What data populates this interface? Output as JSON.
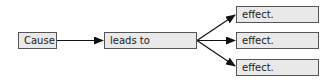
{
  "diagram": {
    "type": "cause-effect flow",
    "cause": {
      "label": "Cause"
    },
    "connector": {
      "label": "leads to"
    },
    "effects": [
      {
        "label": "effect."
      },
      {
        "label": "effect."
      },
      {
        "label": "effect."
      }
    ],
    "colors": {
      "box_fill": "#e9e9e9",
      "box_border": "#555555",
      "arrow": "#111111"
    }
  }
}
